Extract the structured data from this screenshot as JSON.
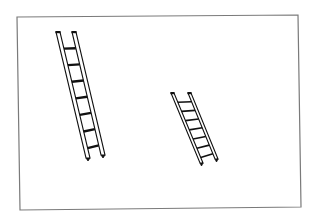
{
  "figure": {
    "frame": {
      "stroke": "#7a7a7a",
      "corners": [
        [
          17,
          17
        ],
        [
          298,
          15
        ],
        [
          301,
          207
        ],
        [
          20,
          210
        ]
      ]
    },
    "ladders": [
      {
        "name": "large-ladder",
        "left_rail": [
          [
            56,
            32
          ],
          [
            86,
            158
          ]
        ],
        "right_rail": [
          [
            72,
            32
          ],
          [
            101,
            155
          ]
        ],
        "rungs": 7,
        "rail_width": 4
      },
      {
        "name": "small-ladder",
        "left_rail": [
          [
            171,
            93
          ],
          [
            200,
            163
          ]
        ],
        "right_rail": [
          [
            188,
            93
          ],
          [
            215,
            159
          ]
        ],
        "rungs": 7,
        "rail_width": 3
      }
    ],
    "colors": {
      "ink": "#111111",
      "background": "#ffffff"
    }
  }
}
